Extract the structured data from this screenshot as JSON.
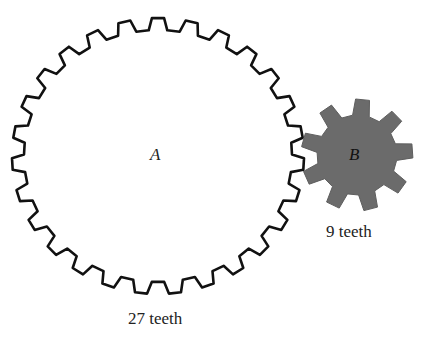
{
  "gears": [
    {
      "id": "A",
      "label": "A",
      "teeth": 27,
      "caption": "27 teeth",
      "fill": "#ffffff",
      "stroke": "#111111"
    },
    {
      "id": "B",
      "label": "B",
      "teeth": 9,
      "caption": "9 teeth",
      "fill": "#6b6b6b",
      "stroke": "#5a5a5a"
    }
  ]
}
